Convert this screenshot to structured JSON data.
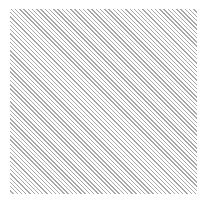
{
  "image": {
    "description": "Square swatch filled with thin diagonal gray hatch lines",
    "pattern": "diagonal-hatch",
    "direction": "top-left to bottom-right",
    "line_color": "#a8a8a8",
    "background_color": "#ffffff"
  }
}
